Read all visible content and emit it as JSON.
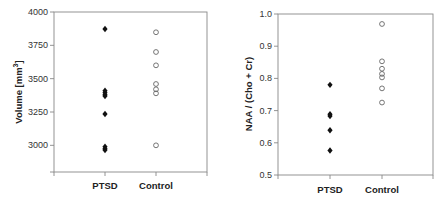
{
  "chart_data": [
    {
      "type": "scatter",
      "title": "",
      "xlabel": "",
      "ylabel": "Volume [mm3]",
      "ylabel_parts": {
        "base": "Volume [mm",
        "sup": "3",
        "tail": "]"
      },
      "categories": [
        "PTSD",
        "Control"
      ],
      "ylim": [
        2800,
        4000
      ],
      "yticks": [
        3000,
        3250,
        3500,
        3750,
        4000
      ],
      "ytick_labels": [
        "3000",
        "3250",
        "3500",
        "3750",
        "4000"
      ],
      "grid": false,
      "legend": "none",
      "series": [
        {
          "name": "PTSD",
          "marker": "filled-diamond",
          "color": "#111111",
          "values": [
            3872,
            3410,
            3395,
            3380,
            3370,
            3235,
            2990,
            2975,
            2965
          ]
        },
        {
          "name": "Control",
          "marker": "open-circle",
          "color": "#555555",
          "values": [
            3848,
            3700,
            3600,
            3460,
            3420,
            3390,
            3000
          ]
        }
      ]
    },
    {
      "type": "scatter",
      "title": "",
      "xlabel": "",
      "ylabel": "NAA / (Cho + Cr)",
      "categories": [
        "PTSD",
        "Control"
      ],
      "ylim": [
        0.5,
        1.0
      ],
      "yticks": [
        0.5,
        0.6,
        0.7,
        0.8,
        0.9,
        1.0
      ],
      "ytick_labels": [
        "0.5",
        "0.6",
        "0.7",
        "0.8",
        "0.9",
        "1.0"
      ],
      "grid": false,
      "legend": "none",
      "series": [
        {
          "name": "PTSD",
          "marker": "filled-diamond",
          "color": "#111111",
          "values": [
            0.78,
            0.689,
            0.683,
            0.639,
            0.576
          ]
        },
        {
          "name": "Control",
          "marker": "open-circle",
          "color": "#555555",
          "values": [
            0.969,
            0.853,
            0.83,
            0.814,
            0.803,
            0.769,
            0.725
          ]
        }
      ]
    }
  ],
  "colors": {
    "axis": "#888888",
    "filled_marker": "#111111",
    "open_marker": "#666666"
  }
}
